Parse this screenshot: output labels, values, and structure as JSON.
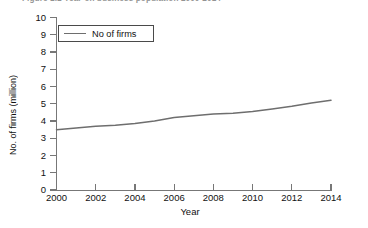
{
  "figure": {
    "title": "Figure 1.1  Year-on business population 2000-2014"
  },
  "legend": {
    "position": "top-left",
    "entries": [
      {
        "label": "No of firms",
        "color": "#6e6e6e"
      }
    ]
  },
  "axes": {
    "y_title": "No. of firms (million)",
    "x_title": "Year",
    "y_ticks": [
      "0",
      "1",
      "2",
      "3",
      "4",
      "5",
      "6",
      "7",
      "8",
      "9",
      "10"
    ],
    "x_ticks": [
      "2000",
      "2002",
      "2004",
      "2006",
      "2008",
      "2010",
      "2012",
      "2014"
    ]
  },
  "colors": {
    "line": "#6e6e6e",
    "axis": "#777777",
    "text": "#111111",
    "background": "#ffffff"
  },
  "chart_data": {
    "type": "line",
    "title": "Figure 1.1  Year-on business population 2000-2014",
    "xlabel": "Year",
    "ylabel": "No. of firms (million)",
    "xlim": [
      2000,
      2014
    ],
    "ylim": [
      0,
      10
    ],
    "ytick_step": 1,
    "xtick_step": 2,
    "grid": false,
    "legend": [
      "No of firms"
    ],
    "x": [
      2000,
      2001,
      2002,
      2003,
      2004,
      2005,
      2006,
      2007,
      2008,
      2009,
      2010,
      2011,
      2012,
      2013,
      2014
    ],
    "series": [
      {
        "name": "No of firms",
        "color": "#6e6e6e",
        "values": [
          3.5,
          3.6,
          3.7,
          3.75,
          3.85,
          4.0,
          4.2,
          4.3,
          4.4,
          4.45,
          4.55,
          4.7,
          4.85,
          5.05,
          5.2
        ]
      }
    ]
  }
}
